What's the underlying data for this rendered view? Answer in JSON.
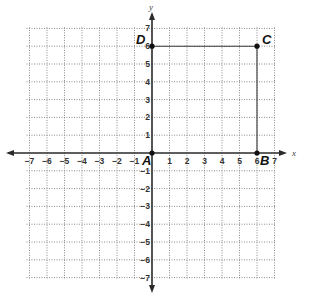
{
  "diagram": {
    "type": "coordinate-plane",
    "axes": {
      "x_label": "x",
      "y_label": "y",
      "x_range": [
        -7,
        7
      ],
      "y_range": [
        -7,
        7
      ]
    },
    "x_ticks": [
      "−7",
      "−6",
      "−5",
      "−4",
      "−3",
      "−2",
      "−1",
      "1",
      "2",
      "3",
      "4",
      "5",
      "6",
      "7"
    ],
    "y_ticks": [
      "7",
      "6",
      "5",
      "4",
      "3",
      "2",
      "1",
      "−1",
      "−2",
      "−3",
      "−4",
      "−5",
      "−6",
      "−7"
    ],
    "points": [
      {
        "label": "A",
        "x": 0,
        "y": 0
      },
      {
        "label": "B",
        "x": 6,
        "y": 0
      },
      {
        "label": "C",
        "x": 6,
        "y": 6
      },
      {
        "label": "D",
        "x": 0,
        "y": 6
      }
    ],
    "segments": [
      {
        "from": "D",
        "to": "C"
      },
      {
        "from": "C",
        "to": "B"
      }
    ]
  }
}
